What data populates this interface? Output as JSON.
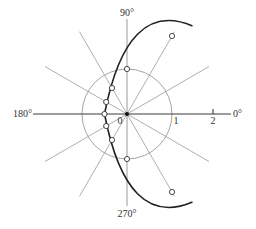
{
  "figure": {
    "type": "polar-plot",
    "equation_form": "r = 1 / (1 - cos θ)",
    "angle_labels": {
      "right": "0°",
      "top": "90°",
      "left": "180°",
      "bottom": "270°"
    },
    "axis_tick_labels": {
      "origin": "0",
      "one": "1",
      "two": "2"
    },
    "radial_line_angles_deg": [
      0,
      30,
      60,
      90,
      120,
      150,
      180,
      210,
      240,
      270,
      300,
      330
    ],
    "marked_points": [
      {
        "theta_deg": 60,
        "r": 2
      },
      {
        "theta_deg": 90,
        "r": 1
      },
      {
        "theta_deg": 120,
        "r": 0.667
      },
      {
        "theta_deg": 150,
        "r": 0.536
      },
      {
        "theta_deg": 180,
        "r": 0.5
      },
      {
        "theta_deg": 210,
        "r": 0.536
      },
      {
        "theta_deg": 240,
        "r": 0.667
      },
      {
        "theta_deg": 270,
        "r": 1
      },
      {
        "theta_deg": 300,
        "r": 2
      }
    ],
    "colors": {
      "curve": "#222222",
      "guides": "#9a9a9a",
      "axis": "#3a3a3a",
      "text": "#333333"
    }
  }
}
